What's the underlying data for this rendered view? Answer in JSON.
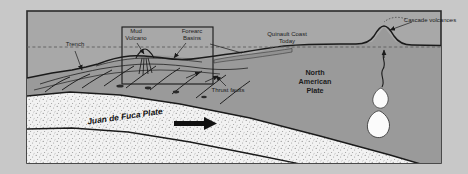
{
  "figure": {
    "type": "geologic-cross-section",
    "canvas": {
      "width": 468,
      "height": 174
    }
  },
  "colors": {
    "outer_margin": "#c8c8c8",
    "panel_fill": "#a8a8a8",
    "panel_border": "#2b2b2b",
    "crust_fill": "#9a9a9a",
    "subducting_plate_fill": "#f2f2f2",
    "stipple": "#8a8a8a",
    "line": "#1a1a1a",
    "sea_level": "#6d6d6d",
    "magma_fill": "#fbfbfb",
    "text": "#1c1c1c"
  },
  "labels": {
    "trench": "Trench",
    "mud_volcano": "Mud\nVolcano",
    "mud_volcano_line1": "Mud",
    "mud_volcano_line2": "Volcano",
    "forearc_basins_line1": "Forearc",
    "forearc_basins_line2": "Basins",
    "quinault_coast_line1": "Quinault Coast",
    "quinault_coast_line2": "Today",
    "cascade_volcanoes": "Cascade volcanoes",
    "thrust_faults": "Thrust faults",
    "north_american_plate_line1": "North",
    "north_american_plate_line2": "American",
    "north_american_plate_line3": "Plate",
    "juan_de_fuca_plate": "Juan de Fuca Plate"
  },
  "features": [
    {
      "name": "trench",
      "label": "Trench",
      "kind": "annotation",
      "x": 75,
      "y": 46
    },
    {
      "name": "mud-volcano",
      "label": "Mud Volcano",
      "kind": "annotation",
      "x": 136,
      "y": 33
    },
    {
      "name": "forearc-basins",
      "label": "Forearc Basins",
      "kind": "annotation",
      "x": 189,
      "y": 33
    },
    {
      "name": "quinault-coast-today",
      "label": "Quinault Coast Today",
      "kind": "annotation",
      "x": 285,
      "y": 36
    },
    {
      "name": "cascade-volcanoes",
      "label": "Cascade volcanoes",
      "kind": "annotation",
      "x": 431,
      "y": 21
    },
    {
      "name": "thrust-faults",
      "label": "Thrust faults",
      "kind": "annotation",
      "x": 213,
      "y": 89
    },
    {
      "name": "north-american-plate",
      "label": "North American Plate",
      "kind": "plate",
      "x": 315,
      "y": 83
    },
    {
      "name": "juan-de-fuca-plate",
      "label": "Juan de Fuca Plate",
      "kind": "plate",
      "x": 125,
      "y": 117
    }
  ],
  "magma_bodies": [
    {
      "name": "upper-magma-body",
      "cx": 381,
      "cy": 96
    },
    {
      "name": "lower-magma-body",
      "cx": 379,
      "cy": 122
    }
  ],
  "inset": {
    "name": "detail-box",
    "x": 122,
    "y": 27,
    "width": 91,
    "height": 57
  },
  "sea_level": {
    "name": "sea-level-line",
    "y": 47,
    "style": "dashed"
  },
  "subduction_arrow": {
    "name": "subduction-direction-arrow",
    "direction": "right",
    "x": 200,
    "y": 121
  }
}
